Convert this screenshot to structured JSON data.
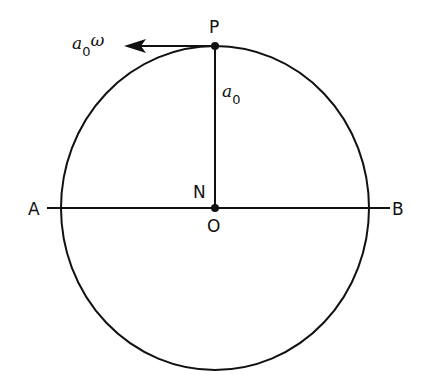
{
  "diagram": {
    "points": {
      "P": "P",
      "N": "N",
      "O": "O",
      "A": "A",
      "B": "B"
    },
    "radius_label": {
      "symbol": "a",
      "subscript": "0"
    },
    "velocity_label": {
      "symbol": "a",
      "subscript": "0",
      "suffix": "ω"
    },
    "colors": {
      "line": "#111111",
      "background": "#ffffff"
    }
  }
}
